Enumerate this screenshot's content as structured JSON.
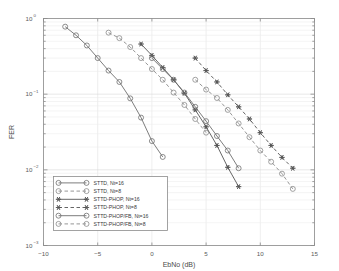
{
  "chart_data": {
    "type": "line",
    "title": "",
    "xlabel": "EbNo (dB)",
    "ylabel": "FER",
    "xlim": [
      -10,
      15
    ],
    "ylim": [
      0.001,
      1
    ],
    "yscale": "log",
    "grid": true,
    "legend_position": "lower-left",
    "xticks": [
      -10,
      -5,
      0,
      5,
      10,
      15
    ],
    "xtick_labels": [
      "-10",
      "-5",
      "0",
      "5",
      "10",
      "15"
    ],
    "yticks": [
      1,
      0.1,
      0.01,
      0.001
    ],
    "ytick_labels": [
      "10^0",
      "10^-1",
      "10^-2",
      "10^-3"
    ],
    "ytick_mantissa": [
      "10",
      "10",
      "10",
      "10"
    ],
    "ytick_exponent": [
      "0",
      "-1",
      "-2",
      "-3"
    ],
    "series": [
      {
        "name": "STTD, Nt=16",
        "marker": "circle",
        "linestyle": "solid",
        "color": "#6e6e6e",
        "x": [
          -8,
          -7,
          -6,
          -5,
          -4,
          -3,
          -2,
          -1,
          0,
          1
        ],
        "y": [
          0.78,
          0.6,
          0.44,
          0.3,
          0.205,
          0.145,
          0.088,
          0.049,
          0.024,
          0.0148
        ]
      },
      {
        "name": "STTD, Nt=8",
        "marker": "circle",
        "linestyle": "dashed",
        "color": "#8a8a8a",
        "x": [
          -4,
          -3,
          -2,
          -1,
          0,
          1,
          2,
          3,
          4,
          5
        ],
        "y": [
          0.65,
          0.55,
          0.42,
          0.3,
          0.215,
          0.155,
          0.105,
          0.072,
          0.047,
          0.031
        ]
      },
      {
        "name": "STTD-PHOP, Nt=16",
        "marker": "star",
        "linestyle": "solid",
        "color": "#555555",
        "x": [
          -1,
          0,
          1,
          2,
          3,
          4,
          5,
          6,
          7,
          8
        ],
        "y": [
          0.46,
          0.325,
          0.225,
          0.155,
          0.103,
          0.062,
          0.037,
          0.021,
          0.0108,
          0.006
        ]
      },
      {
        "name": "STTD-PHOP, Nt=8",
        "marker": "star",
        "linestyle": "dashed",
        "color": "#555555",
        "x": [
          4,
          5,
          6,
          7,
          8,
          9,
          10,
          11,
          12,
          13
        ],
        "y": [
          0.3,
          0.205,
          0.145,
          0.098,
          0.068,
          0.047,
          0.031,
          0.021,
          0.0146,
          0.0105
        ]
      },
      {
        "name": "STTD-PHOP/FB, Nt=16",
        "marker": "circle",
        "linestyle": "solid",
        "color": "#6e6e6e",
        "x": [
          0,
          1,
          2,
          3,
          4,
          5,
          6,
          7,
          8
        ],
        "y": [
          0.3,
          0.215,
          0.155,
          0.105,
          0.068,
          0.044,
          0.028,
          0.018,
          0.0105
        ]
      },
      {
        "name": "STTD-PHOP/FB, Nt=8",
        "marker": "circle",
        "linestyle": "dashed",
        "color": "#8a8a8a",
        "x": [
          4,
          5,
          6,
          7,
          8,
          9,
          10,
          11,
          12,
          13
        ],
        "y": [
          0.155,
          0.115,
          0.089,
          0.062,
          0.041,
          0.027,
          0.018,
          0.0128,
          0.0089,
          0.0056
        ]
      }
    ]
  },
  "legend": {
    "entries": [
      "STTD, Nt=16",
      "STTD, Nt=8",
      "STTD-PHOP, Nt=16",
      "STTD-PHOP, Nt=8",
      "STTD-PHOP/FB, Nt=16",
      "STTD-PHOP/FB, Nt=8"
    ]
  },
  "style": {
    "background": "#ffffff",
    "axis_color": "#8c8c8c",
    "grid_color": "#e2e2e2",
    "text_color": "#4a4a4a"
  }
}
